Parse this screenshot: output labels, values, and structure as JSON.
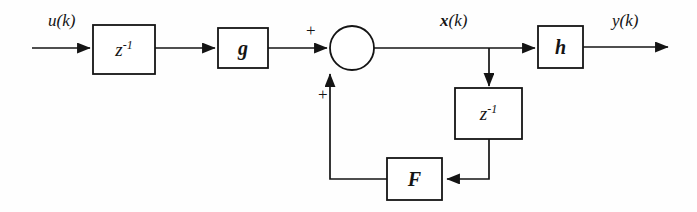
{
  "figure": {
    "kind": "signal-flow-block-diagram",
    "background_color": "#fefefe",
    "line_color": "#141414"
  },
  "blocks": [
    {
      "id": "delay-input",
      "label": "z",
      "exponent": "-1",
      "kind": "delay",
      "x": 93,
      "y": 25,
      "w": 62,
      "h": 49
    },
    {
      "id": "gain-g",
      "label": "g",
      "exponent": "",
      "kind": "gain",
      "x": 218,
      "y": 28,
      "w": 50,
      "h": 40
    },
    {
      "id": "gain-h",
      "label": "h",
      "exponent": "",
      "kind": "gain",
      "x": 538,
      "y": 26,
      "w": 45,
      "h": 42
    },
    {
      "id": "delay-state",
      "label": "z",
      "exponent": "-1",
      "kind": "delay",
      "x": 455,
      "y": 88,
      "w": 67,
      "h": 51
    },
    {
      "id": "gain-F",
      "label": "F",
      "exponent": "",
      "kind": "gain",
      "x": 387,
      "y": 158,
      "w": 55,
      "h": 42
    }
  ],
  "summing_junction": {
    "id": "sum-node",
    "cx": 352,
    "cy": 48,
    "r": 22,
    "inputs": [
      {
        "sign": "+",
        "from": "left",
        "label_x": 306,
        "label_y": 22
      },
      {
        "sign": "+",
        "from": "bottom",
        "label_x": 318,
        "label_y": 86
      }
    ]
  },
  "signals": [
    {
      "id": "input-signal",
      "text": "u(k)",
      "bold_part": "",
      "rest": "(k)",
      "lead": "u",
      "x": 48,
      "y": 12,
      "bold": false
    },
    {
      "id": "state-signal",
      "text": "x(k)",
      "bold_part": "x",
      "rest": "(k)",
      "lead": "x",
      "x": 440,
      "y": 12,
      "bold": true
    },
    {
      "id": "output-signal",
      "text": "y(k)",
      "bold_part": "",
      "rest": "(k)",
      "lead": "y",
      "x": 612,
      "y": 12,
      "bold": false
    }
  ],
  "connections": [
    {
      "id": "wire-in-to-delay",
      "from": "input-terminal",
      "to": "delay-input",
      "arrow": true
    },
    {
      "id": "wire-delay-to-g",
      "from": "delay-input",
      "to": "gain-g",
      "arrow": true
    },
    {
      "id": "wire-g-to-sum",
      "from": "gain-g",
      "to": "sum-node",
      "arrow": true
    },
    {
      "id": "wire-sum-to-h",
      "from": "sum-node",
      "to": "gain-h",
      "arrow": true
    },
    {
      "id": "wire-h-to-out",
      "from": "gain-h",
      "to": "output-terminal",
      "arrow": true
    },
    {
      "id": "wire-state-tap-down",
      "from": "state-tap",
      "to": "delay-state",
      "arrow": true
    },
    {
      "id": "wire-delay-to-F",
      "from": "delay-state",
      "to": "gain-F",
      "arrow": true
    },
    {
      "id": "wire-F-to-sum",
      "from": "gain-F",
      "to": "sum-node",
      "arrow": true
    }
  ],
  "terminals": {
    "input_start_x": 32,
    "input_y": 48,
    "output_end_x": 670,
    "output_y": 47,
    "state_tap_x": 489
  }
}
